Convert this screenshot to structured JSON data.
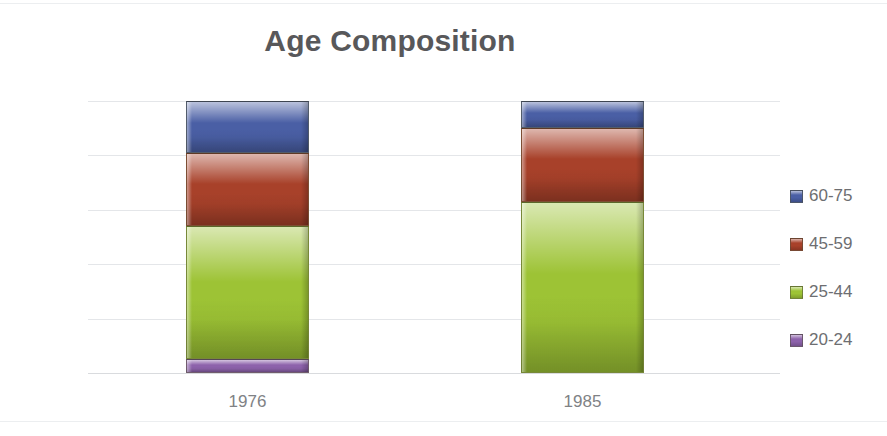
{
  "chart_data": {
    "type": "bar",
    "subtype": "100% stacked column",
    "title": "Age Composition",
    "xlabel": "",
    "ylabel": "",
    "categories": [
      "1976",
      "1985"
    ],
    "series": [
      {
        "name": "20-24",
        "color": "#8d62ab",
        "values": [
          5,
          0
        ]
      },
      {
        "name": "25-44",
        "color": "#9dc335",
        "values": [
          49,
          63
        ]
      },
      {
        "name": "45-59",
        "color": "#a8412a",
        "values": [
          27,
          27
        ]
      },
      {
        "name": "60-75",
        "color": "#4a5fa5",
        "values": [
          19,
          10
        ]
      }
    ],
    "stack_order_bottom_to_top": [
      "20-24",
      "25-44",
      "45-59",
      "60-75"
    ],
    "ylim": [
      0,
      100
    ],
    "y_ticks": [
      "0%",
      "20%",
      "40%",
      "60%",
      "80%",
      "100%"
    ],
    "y_tick_values": [
      0,
      20,
      40,
      60,
      80,
      100
    ],
    "grid": true,
    "legend_position": "right",
    "legend_entries": [
      "60-75",
      "45-59",
      "25-44",
      "20-24"
    ]
  },
  "title": {
    "text": "Age Composition"
  },
  "axes": {
    "y_ticks": [
      {
        "label": "100%",
        "value": 100
      },
      {
        "label": "80%",
        "value": 80
      },
      {
        "label": "60%",
        "value": 60
      },
      {
        "label": "40%",
        "value": 40
      },
      {
        "label": "20%",
        "value": 20
      },
      {
        "label": "0%",
        "value": 0
      }
    ],
    "x_ticks": [
      {
        "label": "1976"
      },
      {
        "label": "1985"
      }
    ]
  },
  "legend": {
    "items": [
      {
        "label": "60-75",
        "color": "#4a5fa5"
      },
      {
        "label": "45-59",
        "color": "#a8412a"
      },
      {
        "label": "25-44",
        "color": "#9dc335"
      },
      {
        "label": "20-24",
        "color": "#8d62ab"
      }
    ]
  },
  "colors": {
    "title": "#58585a",
    "tick_text": "#808285",
    "gridline": "#e4e6e9",
    "background": "#ffffff",
    "series_60_75": "#4a5fa5",
    "series_45_59": "#a8412a",
    "series_25_44": "#9dc335",
    "series_20_24": "#8d62ab"
  }
}
